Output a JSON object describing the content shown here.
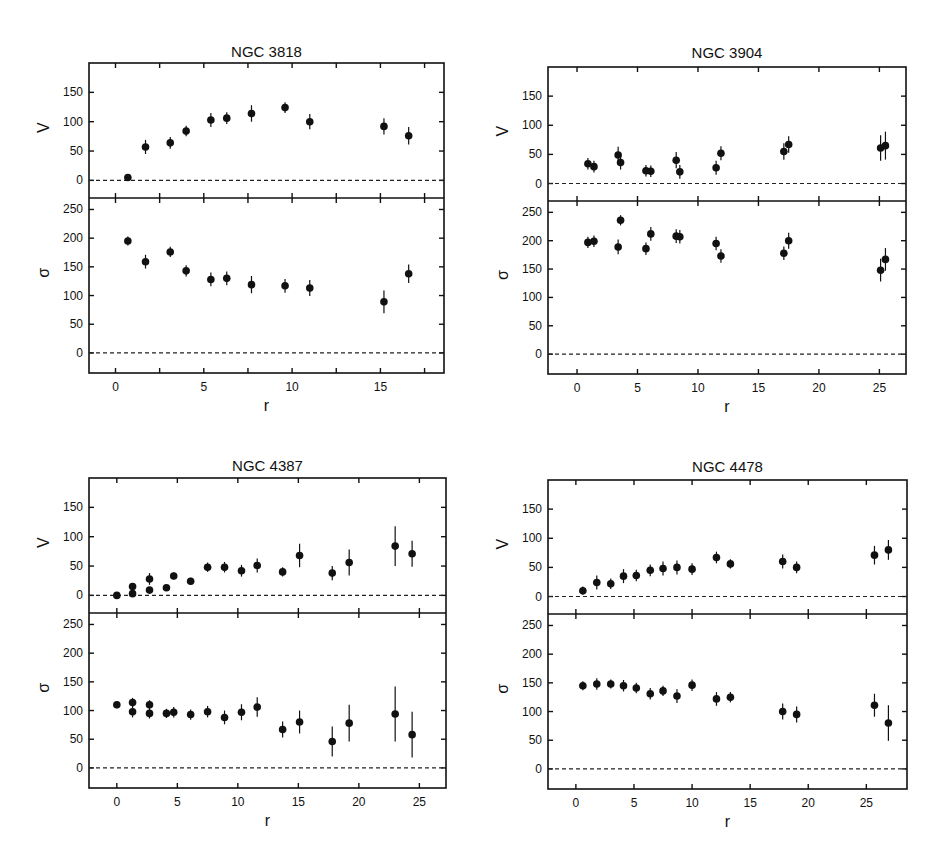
{
  "chart_data": [
    {
      "type": "scatter",
      "title": "NGC 3818",
      "xlabel": "r",
      "panels": [
        {
          "ylabel": "V",
          "ylim": [
            -30,
            200
          ],
          "yticks": [
            0,
            50,
            100,
            150
          ],
          "x": [
            0.7,
            1.7,
            3.1,
            4.0,
            5.4,
            6.3,
            7.7,
            9.6,
            11.0,
            15.2,
            16.6
          ],
          "y": [
            5,
            57,
            64,
            84,
            103,
            106,
            114,
            124,
            100,
            92,
            76
          ],
          "err": [
            4,
            12,
            10,
            9,
            12,
            10,
            14,
            9,
            13,
            14,
            15
          ]
        },
        {
          "ylabel": "σ",
          "ylim": [
            -35,
            270
          ],
          "yticks": [
            0,
            50,
            100,
            150,
            200,
            250
          ],
          "x": [
            0.7,
            1.7,
            3.1,
            4.0,
            5.4,
            6.3,
            7.7,
            9.6,
            11.0,
            15.2,
            16.6
          ],
          "y": [
            195,
            159,
            176,
            143,
            128,
            130,
            119,
            117,
            113,
            89,
            138
          ],
          "err": [
            8,
            12,
            9,
            10,
            12,
            12,
            15,
            12,
            14,
            20,
            16
          ]
        }
      ],
      "xlim": [
        -1.5,
        18.6
      ],
      "xticks": [
        0,
        5,
        10,
        15
      ],
      "minor_xticks": [
        2.5,
        7.5,
        12.5,
        17.5
      ]
    },
    {
      "type": "scatter",
      "title": "NGC 3904",
      "xlabel": "r",
      "panels": [
        {
          "ylabel": "V",
          "ylim": [
            -30,
            200
          ],
          "yticks": [
            0,
            50,
            100,
            150
          ],
          "x": [
            0.9,
            1.4,
            3.4,
            3.6,
            5.7,
            6.1,
            8.2,
            8.5,
            11.5,
            11.9,
            17.1,
            17.5,
            25.1,
            25.5
          ],
          "y": [
            34,
            29,
            49,
            36,
            22,
            21,
            40,
            20,
            27,
            52,
            55,
            67,
            61,
            65
          ],
          "err": [
            10,
            10,
            14,
            12,
            10,
            10,
            14,
            12,
            12,
            12,
            14,
            14,
            22,
            24
          ]
        },
        {
          "ylabel": "σ",
          "ylim": [
            -35,
            270
          ],
          "yticks": [
            0,
            50,
            100,
            150,
            200,
            250
          ],
          "x": [
            0.9,
            1.4,
            3.4,
            3.6,
            5.7,
            6.1,
            8.2,
            8.5,
            11.5,
            11.9,
            17.1,
            17.5,
            25.1,
            25.5
          ],
          "y": [
            197,
            199,
            189,
            236,
            186,
            212,
            208,
            207,
            195,
            173,
            178,
            200,
            148,
            167
          ],
          "err": [
            10,
            10,
            13,
            9,
            11,
            12,
            12,
            12,
            12,
            12,
            12,
            14,
            20,
            20
          ]
        }
      ],
      "xlim": [
        -2.4,
        27.2
      ],
      "xticks": [
        0,
        5,
        10,
        15,
        20,
        25
      ],
      "minor_xticks": []
    },
    {
      "type": "scatter",
      "title": "NGC 4387",
      "xlabel": "r",
      "panels": [
        {
          "ylabel": "V",
          "ylim": [
            -30,
            200
          ],
          "yticks": [
            0,
            50,
            100,
            150
          ],
          "x": [
            0.0,
            1.3,
            1.3,
            2.7,
            2.7,
            4.1,
            4.7,
            6.1,
            7.5,
            8.9,
            10.3,
            11.6,
            13.7,
            15.1,
            17.8,
            19.2,
            23.0,
            24.4
          ],
          "y": [
            0,
            15,
            3,
            28,
            9,
            13,
            33,
            24,
            48,
            48,
            42,
            51,
            40,
            68,
            38,
            56,
            84,
            71
          ],
          "err": [
            2,
            6,
            3,
            10,
            3,
            3,
            6,
            6,
            8,
            9,
            10,
            12,
            8,
            20,
            12,
            22,
            34,
            22
          ]
        },
        {
          "ylabel": "σ",
          "ylim": [
            -35,
            270
          ],
          "yticks": [
            0,
            50,
            100,
            150,
            200,
            250
          ],
          "x": [
            0.0,
            1.3,
            1.3,
            2.7,
            2.7,
            4.1,
            4.7,
            6.1,
            7.5,
            8.9,
            10.3,
            11.6,
            13.7,
            15.1,
            17.8,
            19.2,
            23.0,
            24.4
          ],
          "y": [
            110,
            114,
            98,
            110,
            95,
            95,
            97,
            93,
            98,
            88,
            97,
            106,
            67,
            80,
            46,
            78,
            94,
            58
          ],
          "err": [
            6,
            8,
            10,
            8,
            9,
            8,
            9,
            9,
            10,
            12,
            14,
            17,
            14,
            20,
            26,
            32,
            48,
            40
          ]
        }
      ],
      "xlim": [
        -2.3,
        27.2
      ],
      "xticks": [
        0,
        5,
        10,
        15,
        20,
        25
      ],
      "minor_xticks": []
    },
    {
      "type": "scatter",
      "title": "NGC 4478",
      "xlabel": "r",
      "panels": [
        {
          "ylabel": "V",
          "ylim": [
            -30,
            200
          ],
          "yticks": [
            0,
            50,
            100,
            150
          ],
          "x": [
            0.6,
            1.8,
            3.0,
            4.1,
            5.2,
            6.4,
            7.5,
            8.7,
            10.0,
            12.1,
            13.3,
            17.8,
            19.0,
            25.7,
            26.9
          ],
          "y": [
            10,
            24,
            22,
            35,
            36,
            45,
            48,
            50,
            47,
            67,
            56,
            60,
            50,
            71,
            80
          ],
          "err": [
            7,
            12,
            9,
            12,
            10,
            10,
            12,
            12,
            10,
            10,
            8,
            12,
            10,
            16,
            17
          ]
        },
        {
          "ylabel": "σ",
          "ylim": [
            -35,
            270
          ],
          "yticks": [
            0,
            50,
            100,
            150,
            200,
            250
          ],
          "x": [
            0.6,
            1.8,
            3.0,
            4.1,
            5.2,
            6.4,
            7.5,
            8.7,
            10.0,
            12.1,
            13.3,
            17.8,
            19.0,
            25.7,
            26.9
          ],
          "y": [
            145,
            148,
            148,
            145,
            141,
            131,
            136,
            127,
            146,
            122,
            125,
            100,
            95,
            111,
            80
          ],
          "err": [
            8,
            10,
            8,
            10,
            9,
            10,
            9,
            12,
            10,
            12,
            9,
            14,
            14,
            20,
            31
          ]
        }
      ],
      "xlim": [
        -2.4,
        28.5
      ],
      "xticks": [
        0,
        5,
        10,
        15,
        20,
        25
      ],
      "minor_xticks": []
    }
  ],
  "figure": {
    "panels": [
      {
        "title": "NGC 3818",
        "ylabel_top": "V",
        "ylabel_bottom": "σ",
        "xlabel": "r"
      },
      {
        "title": "NGC 3904",
        "ylabel_top": "V",
        "ylabel_bottom": "σ",
        "xlabel": "r"
      },
      {
        "title": "NGC 4387",
        "ylabel_top": "V",
        "ylabel_bottom": "σ",
        "xlabel": "r"
      },
      {
        "title": "NGC 4478",
        "ylabel_top": "V",
        "ylabel_bottom": "σ",
        "xlabel": "r"
      }
    ]
  }
}
